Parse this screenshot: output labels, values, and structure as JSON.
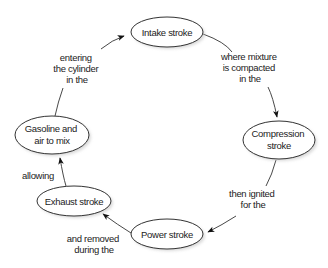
{
  "diagram": {
    "type": "cycle",
    "title": "",
    "nodes": [
      {
        "id": "intake",
        "label_lines": [
          "Intake stroke"
        ],
        "cx": 167,
        "cy": 32,
        "rx": 36,
        "ry": 15
      },
      {
        "id": "compression",
        "label_lines": [
          "Compression",
          "stroke"
        ],
        "cx": 279,
        "cy": 140,
        "rx": 36,
        "ry": 19
      },
      {
        "id": "power",
        "label_lines": [
          "Power stroke"
        ],
        "cx": 167,
        "cy": 234,
        "rx": 36,
        "ry": 15
      },
      {
        "id": "exhaust",
        "label_lines": [
          "Exhaust stroke"
        ],
        "cx": 74,
        "cy": 201,
        "rx": 37,
        "ry": 15
      },
      {
        "id": "gasoline",
        "label_lines": [
          "Gasoline and",
          "air to mix"
        ],
        "cx": 52,
        "cy": 135,
        "rx": 37,
        "ry": 19
      }
    ],
    "edges": [
      {
        "from": "intake",
        "to": "compression",
        "label_lines": [
          "where mixture",
          "is compacted",
          "in the"
        ]
      },
      {
        "from": "compression",
        "to": "power",
        "label_lines": [
          "then ignited",
          "for the"
        ]
      },
      {
        "from": "power",
        "to": "exhaust",
        "label_lines": [
          "and removed",
          "during the"
        ]
      },
      {
        "from": "exhaust",
        "to": "gasoline",
        "label_lines": [
          "allowing"
        ]
      },
      {
        "from": "gasoline",
        "to": "intake",
        "label_lines": [
          "entering",
          "the cylinder",
          "in the"
        ]
      }
    ]
  }
}
